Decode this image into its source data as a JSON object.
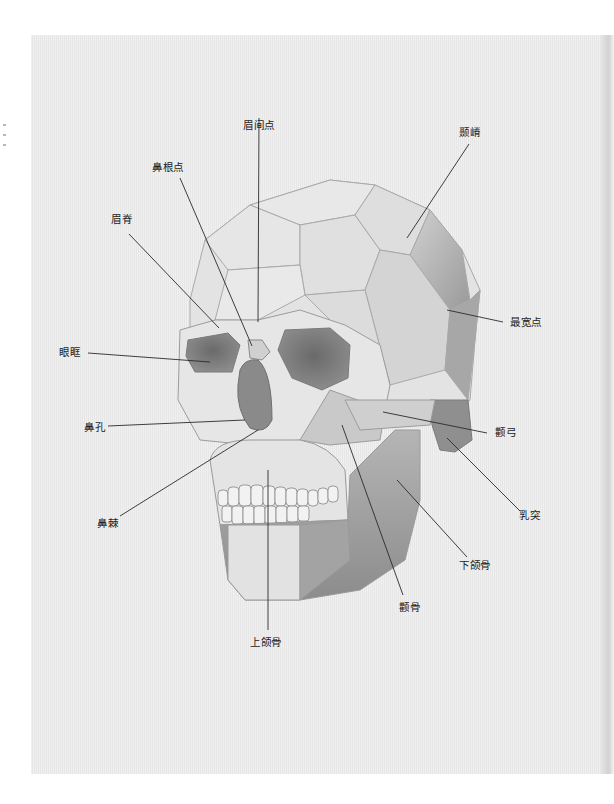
{
  "figure": {
    "labels": {
      "meijiandian": "眉间点",
      "niegi": "颞嵴",
      "bigendian": "鼻根点",
      "meiji": "眉脊",
      "zuikuandian": "最宽点",
      "yankuang": "眼眶",
      "bikong": "鼻孔",
      "niegong": "颧弓",
      "rutu": "乳突",
      "biji": "鼻棘",
      "xiahegu": "下颌骨",
      "quangu": "颧骨",
      "shanghegu": "上颌骨"
    }
  },
  "colors": {
    "page": "#ebebeb",
    "line": "#2a2a2a",
    "shade_dark": "#6e6e6e",
    "shade_mid": "#a8a8a8",
    "shade_light": "#d6d6d6"
  }
}
